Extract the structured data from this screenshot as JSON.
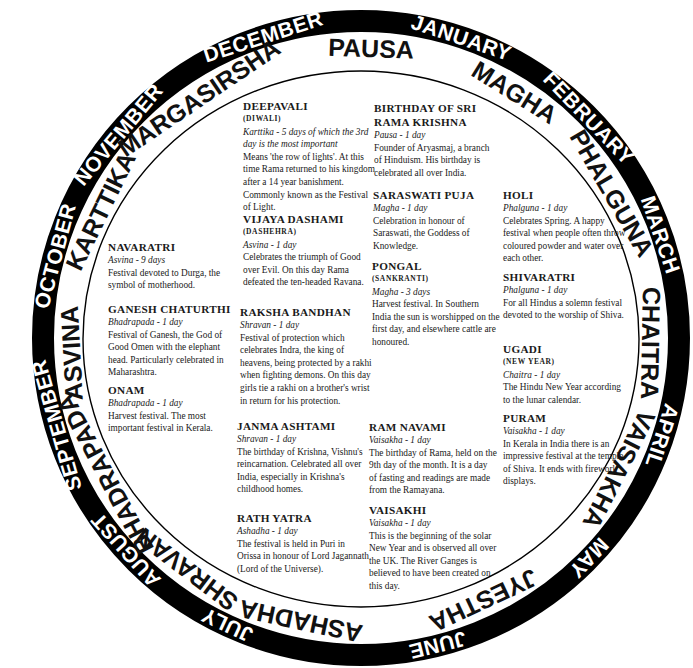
{
  "wheel": {
    "center": [
      361,
      338
    ],
    "ring_color": "#000000",
    "gregorian_months": [
      {
        "label": "JANUARY",
        "angle": 18.5
      },
      {
        "label": "FEBRUARY",
        "angle": 46
      },
      {
        "label": "MARCH",
        "angle": 71
      },
      {
        "label": "APRIL",
        "angle": 108
      },
      {
        "label": "MAY",
        "angle": 134
      },
      {
        "label": "JUNE",
        "angle": 166
      },
      {
        "label": "JULY",
        "angle": -155
      },
      {
        "label": "AUGUST",
        "angle": -132
      },
      {
        "label": "SEPTEMBER",
        "angle": -106
      },
      {
        "label": "OCTOBER",
        "angle": -75
      },
      {
        "label": "NOVEMBER",
        "angle": -50
      },
      {
        "label": "DECEMBER",
        "angle": -18
      }
    ],
    "hindu_months": [
      {
        "label": "PAUSA",
        "angle": 2
      },
      {
        "label": "MAGHA",
        "angle": 32
      },
      {
        "label": "PHALGUNA",
        "angle": 60
      },
      {
        "label": "CHAITRA",
        "angle": 91
      },
      {
        "label": "VAISAKHA",
        "angle": 117
      },
      {
        "label": "JYESTHA",
        "angle": 155
      },
      {
        "label": "ASHADHA",
        "angle": -168
      },
      {
        "label": "SHRAVAN",
        "angle": -143
      },
      {
        "label": "BHADRAPADA",
        "angle": -118
      },
      {
        "label": "ASVINA",
        "angle": -93
      },
      {
        "label": "KARTTIKA",
        "angle": -64
      },
      {
        "label": "MARGASIRSHA",
        "angle": -34
      }
    ]
  },
  "festivals": [
    {
      "name": "DEEPAVALI",
      "alt": "(DIWALI)",
      "duration": "Karttika - 5 days of which the 3rd day is the most important",
      "description": "Means 'the row of lights'. At this time Rama returned to his kingdom after a 14 year banishment. Commonly known as the Festival of Light."
    },
    {
      "name": "VIJAYA DASHAMI",
      "alt": "(DASHEHRA)",
      "duration": "Asvina - 1 day",
      "description": "Celebrates the triumph of Good over Evil. On this day Rama defeated the ten-headed Ravana."
    },
    {
      "name": "RAKSHA BANDHAN",
      "alt": "",
      "duration": "Shravan - 1 day",
      "description": "Festival of protection which celebrates Indra, the king of heavens, being protected by a rakhi when fighting demons. On this day girls tie a rakhi on a brother's wrist in return for his protection."
    },
    {
      "name": "JANMA ASHTAMI",
      "alt": "",
      "duration": "Shravan - 1 day",
      "description": "The birthday of Krishna, Vishnu's reincarnation. Celebrated all over India, especially in Krishna's childhood homes."
    },
    {
      "name": "RATH YATRA",
      "alt": "",
      "duration": "Ashadha - 1 day",
      "description": "The festival is held in Puri in Orissa in honour of Lord Jagannath (Lord of the Universe)."
    },
    {
      "name": "BIRTHDAY OF SRI RAMA KRISHNA",
      "alt": "",
      "duration": "Pausa - 1 day",
      "description": "Founder of Aryasmaj, a branch of Hinduism. His birthday is celebrated all over India."
    },
    {
      "name": "SARASWATI PUJA",
      "alt": "",
      "duration": "Magha - 1 day",
      "description": "Celebration in honour of Saraswati, the Goddess of Knowledge."
    },
    {
      "name": "PONGAL",
      "alt": "(SANKRANTI)",
      "duration": "Magha - 3 days",
      "description": "Harvest festival. In Southern India the sun is worshipped on the first day, and elsewhere cattle are honoured."
    },
    {
      "name": "RAM NAVAMI",
      "alt": "",
      "duration": "Vaisakha - 1 day",
      "description": "The birthday of Rama, held on the 9th day of the month. It is a day of fasting and readings are made from the Ramayana."
    },
    {
      "name": "VAISAKHI",
      "alt": "",
      "duration": "Vaisakha - 1 day",
      "description": "This is the beginning of the solar New Year and is observed all over the UK. The River Ganges is believed to have been created on this day."
    },
    {
      "name": "HOLI",
      "alt": "",
      "duration": "Phalguna - 1 day",
      "description": "Celebrates Spring. A happy festival when people often throw coloured powder and water over each other."
    },
    {
      "name": "SHIVARATRI",
      "alt": "",
      "duration": "Phalguna - 1 day",
      "description": "For all Hindus a solemn festival devoted to the worship of Shiva."
    },
    {
      "name": "UGADI",
      "alt": "(NEW YEAR)",
      "duration": "Chaitra - 1 day",
      "description": "The Hindu New Year according to the lunar calendar."
    },
    {
      "name": "PURAM",
      "alt": "",
      "duration": "Vaisakha - 1 day",
      "description": "In Kerala in India there is an impressive festival at the temple of Shiva. It ends with firework displays."
    },
    {
      "name": "NAVARATRI",
      "alt": "",
      "duration": "Asvina - 9 days",
      "description": "Festival devoted to Durga, the symbol of motherhood."
    },
    {
      "name": "GANESH CHATURTHI",
      "alt": "",
      "duration": "Bhadrapada - 1 day",
      "description": "Festival of Ganesh, the God of Good Omen with the elephant head. Particularly celebrated in Maharashtra."
    },
    {
      "name": "ONAM",
      "alt": "",
      "duration": "Bhadrapada - 1 day",
      "description": "Harvest festival. The most important festival in Kerala."
    }
  ]
}
